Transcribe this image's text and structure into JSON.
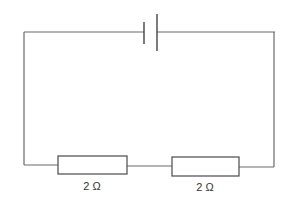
{
  "diagram": {
    "type": "series-circuit",
    "colors": {
      "wire": "#6a6a6a",
      "component": "#4a4a4a",
      "text": "#333333",
      "background": "#ffffff"
    },
    "cell": {
      "symbol": "battery-cell",
      "short_plate_x": 144,
      "long_plate_x": 157
    },
    "resistors": [
      {
        "id": "R1",
        "label": "2 Ω",
        "value": 2,
        "unit": "Ω"
      },
      {
        "id": "R2",
        "label": "2 Ω",
        "value": 2,
        "unit": "Ω"
      }
    ]
  }
}
